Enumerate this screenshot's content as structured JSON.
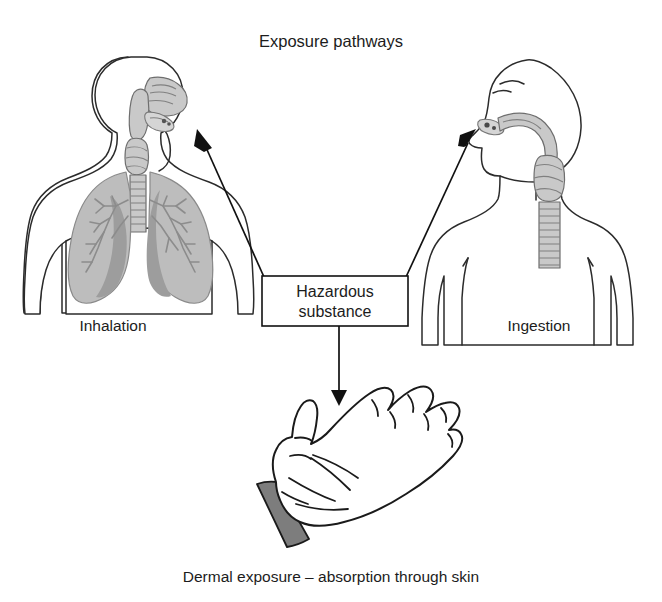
{
  "diagram": {
    "title": "Exposure pathways",
    "caption": "Dermal exposure – absorption through skin",
    "center_node": {
      "line1": "Hazardous",
      "line2": "substance"
    },
    "pathways": [
      {
        "id": "inhalation",
        "label": "Inhalation",
        "icon_name": "torso-respiratory-system-figure",
        "arrow_direction": "up-left"
      },
      {
        "id": "ingestion",
        "label": "Ingestion",
        "icon_name": "head-profile-swallowing-figure",
        "arrow_direction": "up-right"
      },
      {
        "id": "dermal",
        "label": "Dermal exposure – absorption through skin",
        "icon_name": "open-palm-hand",
        "arrow_direction": "down"
      }
    ],
    "colors": {
      "background": "#ffffff",
      "outline": "#2b2b2b",
      "text": "#1c1c1c",
      "lung_fill": "#bdbdbd",
      "lung_shadow": "#9d9d9d",
      "airway_fill": "#c9c9c9",
      "cuff_fill": "#7d7d7d",
      "arrow": "#111111"
    }
  }
}
